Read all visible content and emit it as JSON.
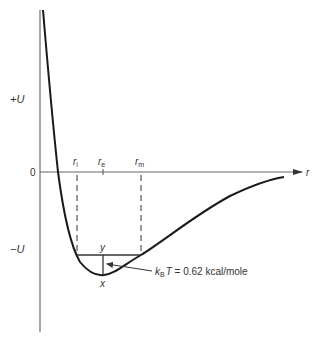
{
  "diagram": {
    "type": "potential-energy-curve",
    "axes": {
      "y_positive_label": "+U",
      "y_negative_label": "−U",
      "origin_label": "0",
      "x_label": "r"
    },
    "markers": {
      "r_i": {
        "base": "r",
        "sub": "i"
      },
      "r_e": {
        "base": "r",
        "sub": "e"
      },
      "r_m": {
        "base": "r",
        "sub": "m"
      }
    },
    "points": {
      "y_label": "y",
      "x_label": "x"
    },
    "annotation": {
      "k": "k",
      "k_sub": "B",
      "T": "T",
      "rest": " = 0.62 kcal/mole"
    },
    "colors": {
      "curve": "#1a1a1a",
      "axis": "#555555",
      "dashed": "#555555",
      "text": "#333333"
    }
  }
}
